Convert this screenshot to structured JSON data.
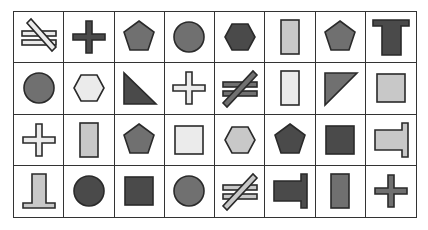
{
  "colors": {
    "dark": "#4a4a4a",
    "medium": "#707070",
    "light": "#c8c8c8",
    "pale": "#ebebeb",
    "stroke": "#2a2a2a"
  },
  "grid": {
    "rows": 4,
    "cols": 8,
    "cells": [
      [
        {
          "shape": "not-equal",
          "fill": "pale",
          "variant": "backslash"
        },
        {
          "shape": "cross",
          "fill": "dark"
        },
        {
          "shape": "pentagon",
          "fill": "medium"
        },
        {
          "shape": "circle",
          "fill": "medium"
        },
        {
          "shape": "hexagon",
          "fill": "dark"
        },
        {
          "shape": "rectangle-tall",
          "fill": "light"
        },
        {
          "shape": "pentagon",
          "fill": "medium"
        },
        {
          "shape": "t-shape",
          "fill": "dark",
          "variant": "up"
        }
      ],
      [
        {
          "shape": "circle",
          "fill": "medium"
        },
        {
          "shape": "hexagon",
          "fill": "pale"
        },
        {
          "shape": "right-triangle",
          "fill": "dark",
          "variant": "bottom-left"
        },
        {
          "shape": "cross",
          "fill": "pale"
        },
        {
          "shape": "not-equal",
          "fill": "medium",
          "variant": "slash"
        },
        {
          "shape": "rectangle-tall",
          "fill": "pale"
        },
        {
          "shape": "right-triangle",
          "fill": "medium",
          "variant": "top-left"
        },
        {
          "shape": "square",
          "fill": "light"
        }
      ],
      [
        {
          "shape": "cross",
          "fill": "pale"
        },
        {
          "shape": "rectangle-tall",
          "fill": "light"
        },
        {
          "shape": "pentagon",
          "fill": "medium"
        },
        {
          "shape": "square",
          "fill": "pale"
        },
        {
          "shape": "hexagon",
          "fill": "light"
        },
        {
          "shape": "pentagon",
          "fill": "dark"
        },
        {
          "shape": "square",
          "fill": "dark"
        },
        {
          "shape": "t-shape",
          "fill": "light",
          "variant": "right"
        }
      ],
      [
        {
          "shape": "t-shape",
          "fill": "light",
          "variant": "down"
        },
        {
          "shape": "circle",
          "fill": "dark"
        },
        {
          "shape": "square",
          "fill": "dark"
        },
        {
          "shape": "circle",
          "fill": "medium"
        },
        {
          "shape": "not-equal",
          "fill": "light",
          "variant": "slash"
        },
        {
          "shape": "t-shape",
          "fill": "dark",
          "variant": "right"
        },
        {
          "shape": "rectangle-tall",
          "fill": "medium"
        },
        {
          "shape": "cross",
          "fill": "medium"
        }
      ]
    ]
  }
}
